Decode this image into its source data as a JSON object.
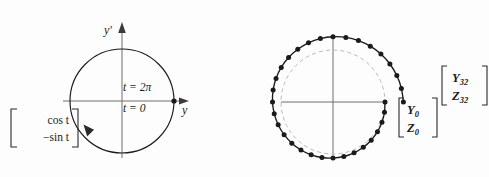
{
  "figure": {
    "background_color": "#fdfdfd",
    "ink_color": "#1a1a1a",
    "axis_color": "#808080",
    "dashed_circle_color": "#b9b9b9"
  },
  "left_panel": {
    "name": "unit-circle-exact-solution",
    "axis_y_label": "y",
    "axis_yprime_label": "y′",
    "label_t_two_pi": "t = 2π",
    "label_t_zero": "t = 0",
    "matrix": {
      "row1": "cos t",
      "row2": "−sin t"
    },
    "circle": {
      "cx": 122,
      "cy": 101,
      "r": 52
    },
    "direction": "clockwise"
  },
  "right_panel": {
    "name": "numerical-spiral-solution",
    "reference_circle": {
      "cx": 333,
      "cy": 102,
      "r": 52,
      "style": "dashed"
    },
    "start_vector": {
      "row1": "Y",
      "row1_sub": "0",
      "row2": "Z",
      "row2_sub": "0"
    },
    "end_vector": {
      "row1": "Y",
      "row1_sub": "32",
      "row2": "Z",
      "row2_sub": "32"
    },
    "point_count": 33,
    "direction": "clockwise",
    "growth_per_step": 1.0095
  },
  "chart_data": {
    "type": "scatter",
    "title": "",
    "xlabel": "",
    "ylabel": "",
    "series": [
      {
        "name": "exact-unit-circle",
        "type": "line",
        "description": "Unit circle traced clockwise from t = 0 to t = 2pi",
        "parametric": "[cos t, -sin t]",
        "radius": 1.0
      },
      {
        "name": "euler-spiral",
        "type": "scatter-line",
        "description": "33 numerical points spiralling outward clockwise from [Y0,Z0] to [Y32,Z32]",
        "n_points": 33,
        "start_index": 0,
        "end_index": 32,
        "start_radius": 1.0,
        "end_radius": 1.36,
        "angles_deg": [
          0,
          -11.25,
          -22.5,
          -33.75,
          -45,
          -56.25,
          -67.5,
          -78.75,
          -90,
          -101.25,
          -112.5,
          -123.75,
          -135,
          -146.25,
          -157.5,
          -168.75,
          -180,
          -191.25,
          -202.5,
          -213.75,
          -225,
          -236.25,
          -247.5,
          -258.75,
          -270,
          -281.25,
          -292.5,
          -303.75,
          -315,
          -326.25,
          -337.5,
          -348.75,
          -360
        ],
        "radii": [
          1.0,
          1.0095,
          1.0191,
          1.0288,
          1.0385,
          1.0484,
          1.0583,
          1.0684,
          1.0785,
          1.0888,
          1.0991,
          1.1096,
          1.1201,
          1.1308,
          1.1415,
          1.1524,
          1.1633,
          1.1744,
          1.1856,
          1.1969,
          1.2082,
          1.2198,
          1.2314,
          1.2431,
          1.2549,
          1.2669,
          1.279,
          1.2911,
          1.3034,
          1.3159,
          1.3284,
          1.341,
          1.3538
        ]
      },
      {
        "name": "reference-unit-circle",
        "type": "dashed-circle",
        "radius": 1.0
      }
    ]
  }
}
